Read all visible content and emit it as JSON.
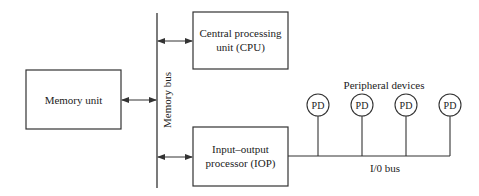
{
  "diagram": {
    "memory_unit": {
      "label": "Memory unit"
    },
    "memory_bus": {
      "label": "Memory bus"
    },
    "cpu": {
      "line1": "Central processing",
      "line2": "unit (CPU)"
    },
    "iop": {
      "line1": "Input–output",
      "line2": "processor (IOP)"
    },
    "peripherals": {
      "group_label": "Peripheral devices",
      "devices": [
        {
          "label": "PD"
        },
        {
          "label": "PD"
        },
        {
          "label": "PD"
        },
        {
          "label": "PD"
        }
      ]
    },
    "io_bus": {
      "label": "I/0 bus"
    },
    "colors": {
      "stroke": "#333333",
      "text": "#222222",
      "background": "#ffffff"
    }
  }
}
